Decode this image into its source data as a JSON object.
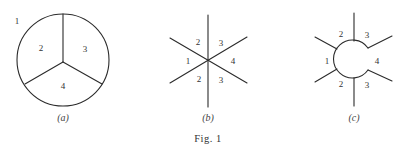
{
  "figure": {
    "caption": "Fig. 1",
    "panels": [
      {
        "id": "a",
        "caption": "(a)",
        "description": "Circle divided into three regions by three spokes meeting at center; region 1 outside",
        "labels": [
          "1",
          "2",
          "3",
          "4"
        ]
      },
      {
        "id": "b",
        "caption": "(b)",
        "description": "Three lines crossing at a single point forming six sectors",
        "labels": [
          "2",
          "3",
          "1",
          "4",
          "2",
          "3"
        ]
      },
      {
        "id": "c",
        "caption": "(c)",
        "description": "Six spokes attached to a small circle with an opening on the right",
        "labels": [
          "2",
          "3",
          "1",
          "4",
          "2",
          "3"
        ]
      }
    ]
  },
  "colors": {
    "line": "#2b2b2b",
    "text": "#333333",
    "background": "#ffffff"
  }
}
